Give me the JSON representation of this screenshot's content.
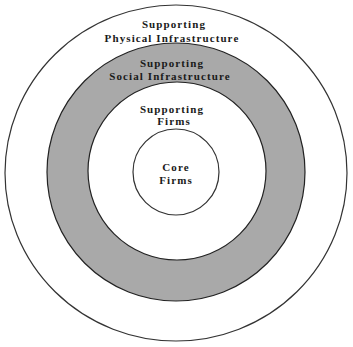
{
  "diagram": {
    "type": "concentric-circles",
    "colors": {
      "background": "#ffffff",
      "stroke": "#333333",
      "shaded_ring": "#a9a9a9",
      "text": "#1a1a1a"
    },
    "rings": [
      {
        "id": "physical",
        "line1": "Supporting",
        "line2": "Physical Infrastructure",
        "shaded": false
      },
      {
        "id": "social",
        "line1": "Supporting",
        "line2": "Social Infrastructure",
        "shaded": true
      },
      {
        "id": "supporting-firms",
        "line1": "Supporting",
        "line2": "Firms",
        "shaded": false
      },
      {
        "id": "core",
        "line1": "Core",
        "line2": "Firms",
        "shaded": false
      }
    ]
  }
}
